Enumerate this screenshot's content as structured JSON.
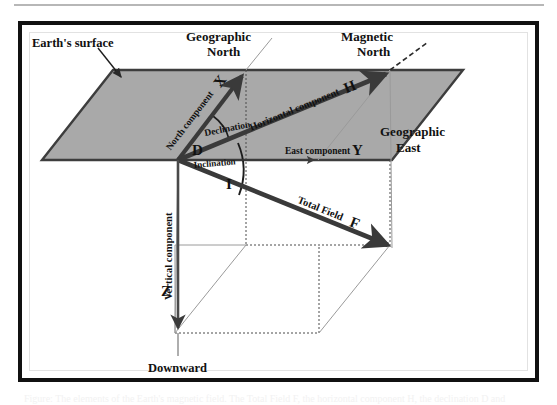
{
  "figure": {
    "type": "diagram",
    "colors": {
      "plane_fill": "#a9a9a9",
      "plane_edge": "#404040",
      "vector_stroke": "#3a3a3a",
      "construction_line": "#8a8a8a",
      "frame": "#111111",
      "inner_frame": "#e2e2e2",
      "text": "#111111",
      "background": "#ffffff"
    }
  },
  "labels": {
    "earth_surface": "Earth's surface",
    "geographic_north_line1": "Geographic",
    "geographic_north_line2": "North",
    "magnetic_north_line1": "Magnetic",
    "magnetic_north_line2": "North",
    "geographic_east_line1": "Geographic",
    "geographic_east_line2": "East",
    "north_component": "North component",
    "north_component_symbol": "X",
    "east_component": "East component",
    "east_component_symbol": "Y",
    "horizontal_component": "Horizontal component",
    "horizontal_component_symbol": "H",
    "vertical_component": "Vertical component",
    "vertical_component_symbol": "Z",
    "total_field": "Total Field",
    "total_field_symbol": "F",
    "declination": "Declination",
    "declination_symbol": "D",
    "inclination": "Inclination",
    "inclination_symbol": "I",
    "downward": "Downward"
  },
  "caption": {
    "text": "Figure: The elements of the Earth's magnetic field. The Total Field F, the horizontal component H, the declination D and"
  }
}
